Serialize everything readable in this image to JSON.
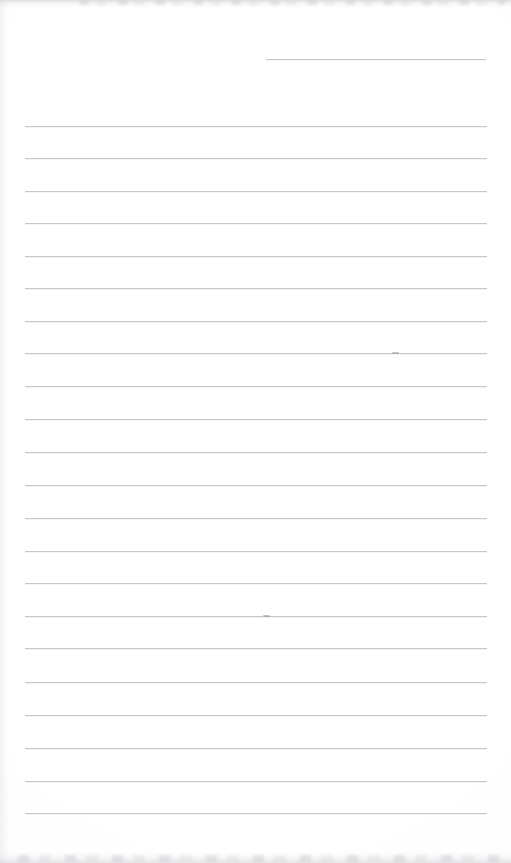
{
  "document": {
    "kind": "scanned-blank-ruled-notepad-page",
    "title": "Blank Ruled Notepad Page",
    "written_text": "",
    "page_background_color": "#fefefe",
    "rule_color": "#c6c6cb",
    "rule_highlight_color": "#f3f3f5",
    "scan_shadow_color": "#c6c6cb",
    "width_px": 511,
    "height_px": 863
  },
  "ruling": {
    "rule_count": 24,
    "full_rule_left_px": 25,
    "full_rule_right_px": 487,
    "full_rule_width_px": 462,
    "line_spacing_px": 32.4,
    "first_rule_is_short": true,
    "short_rule": {
      "label": "top-right short rule",
      "left_px": 266,
      "right_px": 486,
      "width_px": 220,
      "y_px": 59
    },
    "lines": [
      {
        "index": 1,
        "y_px": 59,
        "left_px": 266,
        "width_px": 220,
        "short": true
      },
      {
        "index": 2,
        "y_px": 126,
        "left_px": 25,
        "width_px": 462,
        "short": false
      },
      {
        "index": 3,
        "y_px": 158,
        "left_px": 25,
        "width_px": 462,
        "short": false
      },
      {
        "index": 4,
        "y_px": 191,
        "left_px": 25,
        "width_px": 462,
        "short": false
      },
      {
        "index": 5,
        "y_px": 223,
        "left_px": 25,
        "width_px": 462,
        "short": false
      },
      {
        "index": 6,
        "y_px": 256,
        "left_px": 25,
        "width_px": 462,
        "short": false
      },
      {
        "index": 7,
        "y_px": 288,
        "left_px": 25,
        "width_px": 462,
        "short": false
      },
      {
        "index": 8,
        "y_px": 321,
        "left_px": 25,
        "width_px": 462,
        "short": false
      },
      {
        "index": 9,
        "y_px": 353,
        "left_px": 25,
        "width_px": 462,
        "short": false
      },
      {
        "index": 10,
        "y_px": 386,
        "left_px": 25,
        "width_px": 462,
        "short": false
      },
      {
        "index": 11,
        "y_px": 419,
        "left_px": 25,
        "width_px": 462,
        "short": false
      },
      {
        "index": 12,
        "y_px": 452,
        "left_px": 25,
        "width_px": 462,
        "short": false
      },
      {
        "index": 13,
        "y_px": 485,
        "left_px": 25,
        "width_px": 462,
        "short": false
      },
      {
        "index": 14,
        "y_px": 518,
        "left_px": 25,
        "width_px": 462,
        "short": false
      },
      {
        "index": 15,
        "y_px": 551,
        "left_px": 25,
        "width_px": 462,
        "short": false
      },
      {
        "index": 16,
        "y_px": 583,
        "left_px": 25,
        "width_px": 462,
        "short": false
      },
      {
        "index": 17,
        "y_px": 616,
        "left_px": 25,
        "width_px": 462,
        "short": false
      },
      {
        "index": 18,
        "y_px": 648,
        "left_px": 25,
        "width_px": 462,
        "short": false
      },
      {
        "index": 19,
        "y_px": 682,
        "left_px": 25,
        "width_px": 462,
        "short": false
      },
      {
        "index": 20,
        "y_px": 715,
        "left_px": 25,
        "width_px": 462,
        "short": false
      },
      {
        "index": 21,
        "y_px": 748,
        "left_px": 25,
        "width_px": 462,
        "short": false
      },
      {
        "index": 22,
        "y_px": 781,
        "left_px": 25,
        "width_px": 462,
        "short": false
      },
      {
        "index": 23,
        "y_px": 813,
        "left_px": 25,
        "width_px": 462,
        "short": false
      }
    ]
  },
  "artifacts": {
    "top_shadow_band": {
      "y_px": 0,
      "height_px": 8
    },
    "bottom_shadow_band": {
      "y_px": 851,
      "height_px": 12
    },
    "left_edge_shading": {
      "x_px": 0,
      "width_px": 9
    },
    "specks": [
      {
        "x_px": 392,
        "y_px": 352
      },
      {
        "x_px": 263,
        "y_px": 615
      }
    ]
  }
}
